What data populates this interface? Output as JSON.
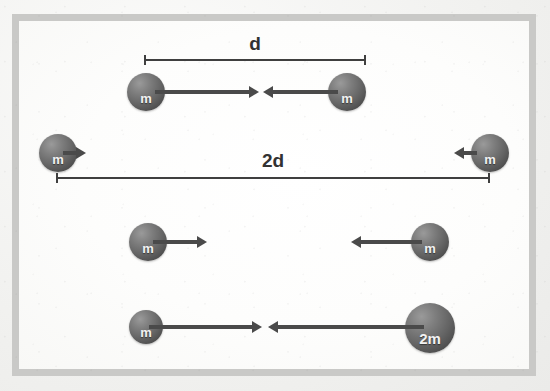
{
  "figure": {
    "background_color": "#fcfcfb",
    "frame_color": "#c9c9c7",
    "sphere_color": "#636363",
    "arrow_color": "#4a4a4a",
    "dimension_color": "#3f3f3f",
    "ghost_text": "",
    "rows": [
      {
        "id": "row-1",
        "left_mass_label": "m",
        "right_mass_label": "m",
        "separation_label": "d",
        "separation_label_position": "above",
        "arrow_style": "long-pair-inward"
      },
      {
        "id": "row-2",
        "left_mass_label": "m",
        "right_mass_label": "m",
        "separation_label": "2d",
        "separation_label_position": "below",
        "arrow_style": "short-pair-inward"
      },
      {
        "id": "row-3",
        "left_mass_label": "m",
        "right_mass_label": "m",
        "separation_label": "",
        "separation_label_position": "none",
        "arrow_style": "medium-pair-inward"
      },
      {
        "id": "row-4",
        "left_mass_label": "m",
        "right_mass_label": "2m",
        "separation_label": "",
        "separation_label_position": "none",
        "arrow_style": "long-pair-meeting"
      }
    ]
  }
}
